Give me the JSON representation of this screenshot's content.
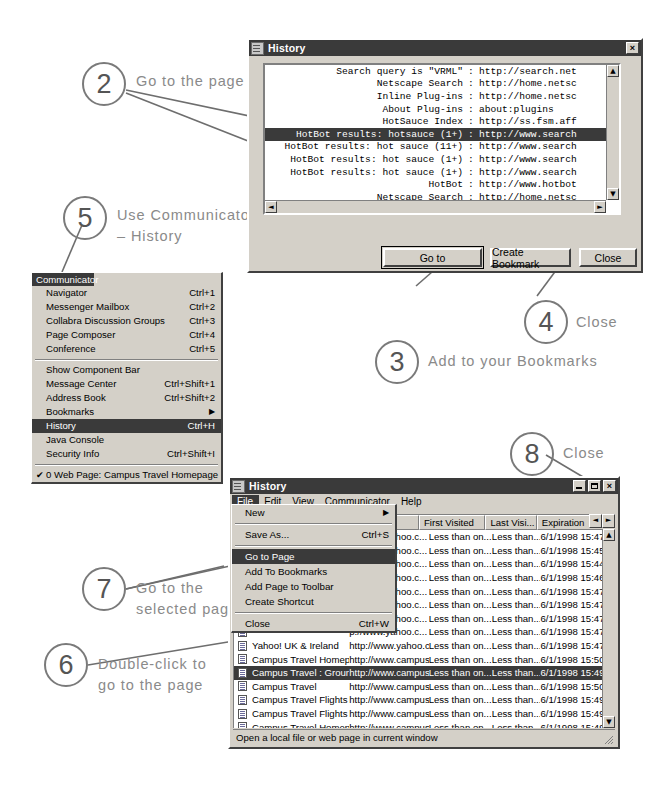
{
  "annotations": [
    {
      "num": "2",
      "text": "Go to the page"
    },
    {
      "num": "5",
      "text": "Use Communicator\n– History"
    },
    {
      "num": "3",
      "text": "Add to your Bookmarks"
    },
    {
      "num": "4",
      "text": "Close"
    },
    {
      "num": "8",
      "text": "Close"
    },
    {
      "num": "7",
      "text": "Go to the\nselected page"
    },
    {
      "num": "6",
      "text": "Double-click to\ngo to the page"
    }
  ],
  "top_history_window": {
    "title": "History",
    "close_label": "×",
    "rows": [
      {
        "title": "Search query is \"VRML\"",
        "sep": ":",
        "url": "http://search.net",
        "selected": false
      },
      {
        "title": "Netscape Search",
        "sep": ":",
        "url": "http://home.netsc",
        "selected": false
      },
      {
        "title": "Inline Plug-ins",
        "sep": ":",
        "url": "http://home.netsc",
        "selected": false
      },
      {
        "title": "About Plug-ins",
        "sep": ":",
        "url": "about:plugins",
        "selected": false
      },
      {
        "title": "HotSauce Index",
        "sep": ":",
        "url": "http://ss.fsm.aff",
        "selected": false
      },
      {
        "title": "HotBot results: hotsauce (1+)",
        "sep": ":",
        "url": "http://www.search",
        "selected": true
      },
      {
        "title": "HotBot results: hot sauce (11+)",
        "sep": ":",
        "url": "http://www.search",
        "selected": false
      },
      {
        "title": "HotBot results: hot sauce (1+)",
        "sep": ":",
        "url": "http://www.search",
        "selected": false
      },
      {
        "title": "HotBot results: hot sauce (1+)",
        "sep": ":",
        "url": "http://www.search",
        "selected": false
      },
      {
        "title": "HotBot",
        "sep": ":",
        "url": "http://www.hotbot",
        "selected": false
      },
      {
        "title": "Netscape Search",
        "sep": ":",
        "url": "http://home.netsc",
        "selected": false
      },
      {
        "title": "Welcome to Netscape",
        "sep": ":",
        "url": "http://home.netsc",
        "selected": false
      }
    ],
    "buttons": {
      "goto": "Go to",
      "create_bookmark": "Create Bookmark",
      "close": "Close"
    }
  },
  "communicator_menu": {
    "title": "Communicator",
    "groups": [
      [
        {
          "label": "Navigator",
          "accel": "Ctrl+1"
        },
        {
          "label": "Messenger Mailbox",
          "accel": "Ctrl+2"
        },
        {
          "label": "Collabra Discussion Groups",
          "accel": "Ctrl+3"
        },
        {
          "label": "Page Composer",
          "accel": "Ctrl+4"
        },
        {
          "label": "Conference",
          "accel": "Ctrl+5"
        }
      ],
      [
        {
          "label": "Show Component Bar",
          "accel": ""
        },
        {
          "label": "Message Center",
          "accel": "Ctrl+Shift+1"
        },
        {
          "label": "Address Book",
          "accel": "Ctrl+Shift+2"
        },
        {
          "label": "Bookmarks",
          "accel": "",
          "submenu": true
        },
        {
          "label": "History",
          "accel": "Ctrl+H",
          "selected": true
        },
        {
          "label": "Java Console",
          "accel": ""
        },
        {
          "label": "Security Info",
          "accel": "Ctrl+Shift+I"
        }
      ],
      [
        {
          "label": "0 Web Page: Campus Travel Homepage",
          "accel": "",
          "checked": true
        }
      ]
    ]
  },
  "bottom_history_window": {
    "title": "History",
    "window_buttons": {
      "minimize": "_",
      "maximize": "□",
      "close": "×"
    },
    "menubar": [
      "File",
      "Edit",
      "View",
      "Communicator",
      "Help"
    ],
    "columns": [
      {
        "label": "Title",
        "key": "title"
      },
      {
        "label": "Location",
        "key": "location"
      },
      {
        "label": "First Visited",
        "key": "first"
      },
      {
        "label": "Last Visi...",
        "key": "last"
      },
      {
        "label": "Expiration",
        "key": "expiration"
      }
    ],
    "rows": [
      {
        "title": "",
        "location": "p://www.yahoo.c...",
        "first": "Less than on...",
        "last": "Less than...",
        "expiration": "6/1/1998 15:47",
        "selected": false
      },
      {
        "title": "",
        "location": "p://www.yahoo.c...",
        "first": "Less than on...",
        "last": "Less than...",
        "expiration": "6/1/1998 15:45",
        "selected": false
      },
      {
        "title": "",
        "location": "p://www.yahoo.c...",
        "first": "Less than on...",
        "last": "Less than...",
        "expiration": "6/1/1998 15:44",
        "selected": false
      },
      {
        "title": "",
        "location": "p://www.yahoo.c...",
        "first": "Less than on...",
        "last": "Less than...",
        "expiration": "6/1/1998 15:46",
        "selected": false
      },
      {
        "title": "",
        "location": "p://www.yahoo.c...",
        "first": "Less than on...",
        "last": "Less than...",
        "expiration": "6/1/1998 15:47",
        "selected": false
      },
      {
        "title": "",
        "location": "p://www.yahoo.c...",
        "first": "Less than on...",
        "last": "Less than...",
        "expiration": "6/1/1998 15:47",
        "selected": false
      },
      {
        "title": "",
        "location": "p://www.yahoo.c...",
        "first": "Less than on...",
        "last": "Less than...",
        "expiration": "6/1/1998 15:47",
        "selected": false
      },
      {
        "title": "",
        "location": "p://www.yahoo.c...",
        "first": "Less than on...",
        "last": "Less than...",
        "expiration": "6/1/1998 15:47",
        "selected": false
      },
      {
        "title": "Yahoo! UK & Ireland",
        "location": "http://www.yahoo.c...",
        "first": "Less than on...",
        "last": "Less than...",
        "expiration": "6/1/1998 15:47",
        "selected": false
      },
      {
        "title": "Campus Travel Homepage",
        "location": "http://www.campust...",
        "first": "Less than on...",
        "last": "Less than...",
        "expiration": "6/1/1998 15:50",
        "selected": false
      },
      {
        "title": "Campus Travel : Ground T...",
        "location": "http://www.campust...",
        "first": "Less than on...",
        "last": "Less than...",
        "expiration": "6/1/1998 15:49",
        "selected": true
      },
      {
        "title": "Campus Travel",
        "location": "http://www.campust...",
        "first": "Less than on...",
        "last": "Less than...",
        "expiration": "6/1/1998 15:50",
        "selected": false
      },
      {
        "title": "Campus Travel Flights",
        "location": "http://www.campust...",
        "first": "Less than on...",
        "last": "Less than...",
        "expiration": "6/1/1998 15:49",
        "selected": false
      },
      {
        "title": "Campus Travel Flights",
        "location": "http://www.campust...",
        "first": "Less than on...",
        "last": "Less than...",
        "expiration": "6/1/1998 15:49",
        "selected": false
      },
      {
        "title": "Campus Travel Homepage",
        "location": "http://www.campust...",
        "first": "Less than on...",
        "last": "Less than...",
        "expiration": "6/1/1998 15:49",
        "selected": false
      },
      {
        "title": "Campus Travel",
        "location": "http://www.campust...",
        "first": "Less than on...",
        "last": "Less than...",
        "expiration": "6/1/1998 15:49",
        "selected": false
      },
      {
        "title": "Campus Travel : Ground T...",
        "location": "http://www.campust...",
        "first": "Less than on...",
        "last": "Less than...",
        "expiration": "6/1/1998 15:49",
        "selected": false
      },
      {
        "title": "Campus Travel Homepage",
        "location": "http://www.campust...",
        "first": "Less than on...",
        "last": "Less than...",
        "expiration": "6/1/1998 15:49",
        "selected": false
      }
    ],
    "status": "Open a local file or web page in current window"
  },
  "file_menu": {
    "items": [
      {
        "label": "New",
        "accel": "",
        "submenu": true
      },
      {
        "sep": true
      },
      {
        "label": "Save As...",
        "accel": "Ctrl+S"
      },
      {
        "sep": true
      },
      {
        "label": "Go to Page",
        "accel": "",
        "selected": true
      },
      {
        "label": "Add To Bookmarks",
        "accel": ""
      },
      {
        "label": "Add Page to Toolbar",
        "accel": ""
      },
      {
        "label": "Create Shortcut",
        "accel": ""
      },
      {
        "sep": true
      },
      {
        "label": "Close",
        "accel": "Ctrl+W"
      }
    ]
  }
}
